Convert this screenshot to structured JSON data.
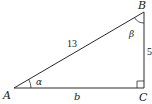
{
  "diagram": {
    "type": "right-triangle",
    "colors": {
      "stroke": "#2a2a2a",
      "text": "#1a1a1a",
      "background": "#ffffff"
    },
    "vertices": [
      {
        "id": "A",
        "label": "A"
      },
      {
        "id": "B",
        "label": "B"
      },
      {
        "id": "C",
        "label": "C"
      }
    ],
    "sides": {
      "hypotenuse": {
        "between": "A-B",
        "label": "13"
      },
      "vertical": {
        "between": "B-C",
        "label": "5"
      },
      "base": {
        "between": "A-C",
        "label": "b"
      }
    },
    "angles": {
      "alpha": {
        "at": "A",
        "label": "α"
      },
      "beta": {
        "at": "B",
        "label": "β"
      },
      "right_angle": {
        "at": "C",
        "marker": "square"
      }
    }
  }
}
